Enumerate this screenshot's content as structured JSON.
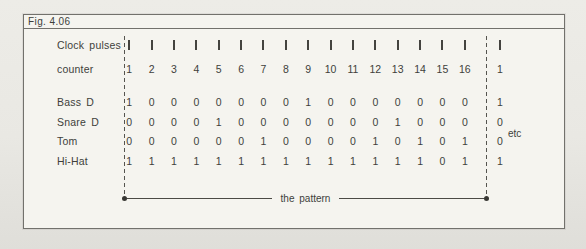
{
  "figure": {
    "label": "Fig. 4.06",
    "pattern_label": "the pattern",
    "etc_label": "etc",
    "colors": {
      "page_bg": "#e9e8e3",
      "box_bg": "#f5f4ef",
      "line": "#72716c",
      "text": "#403f3b"
    }
  },
  "grid": {
    "steps": 16,
    "rows": [
      {
        "label": "Clock pulses",
        "type": "pulse",
        "repeat": "pulse"
      },
      {
        "label": "counter",
        "type": "text",
        "values": [
          "1",
          "2",
          "3",
          "4",
          "5",
          "6",
          "7",
          "8",
          "9",
          "10",
          "11",
          "12",
          "13",
          "14",
          "15",
          "16"
        ],
        "repeat": "1"
      },
      {
        "label": "Bass D",
        "type": "text",
        "values": [
          "1",
          "0",
          "0",
          "0",
          "0",
          "0",
          "0",
          "0",
          "1",
          "0",
          "0",
          "0",
          "0",
          "0",
          "0",
          "0"
        ],
        "repeat": "1"
      },
      {
        "label": "Snare D",
        "type": "text",
        "values": [
          "0",
          "0",
          "0",
          "0",
          "1",
          "0",
          "0",
          "0",
          "0",
          "0",
          "0",
          "0",
          "1",
          "0",
          "0",
          "0"
        ],
        "repeat": "0"
      },
      {
        "label": "Tom",
        "type": "text",
        "values": [
          "0",
          "0",
          "0",
          "0",
          "0",
          "0",
          "1",
          "0",
          "0",
          "0",
          "0",
          "1",
          "0",
          "1",
          "0",
          "1"
        ],
        "repeat": "0"
      },
      {
        "label": "Hi-Hat",
        "type": "text",
        "values": [
          "1",
          "1",
          "1",
          "1",
          "1",
          "1",
          "1",
          "1",
          "1",
          "1",
          "1",
          "1",
          "1",
          "1",
          "0",
          "1"
        ],
        "repeat": "1"
      }
    ]
  }
}
